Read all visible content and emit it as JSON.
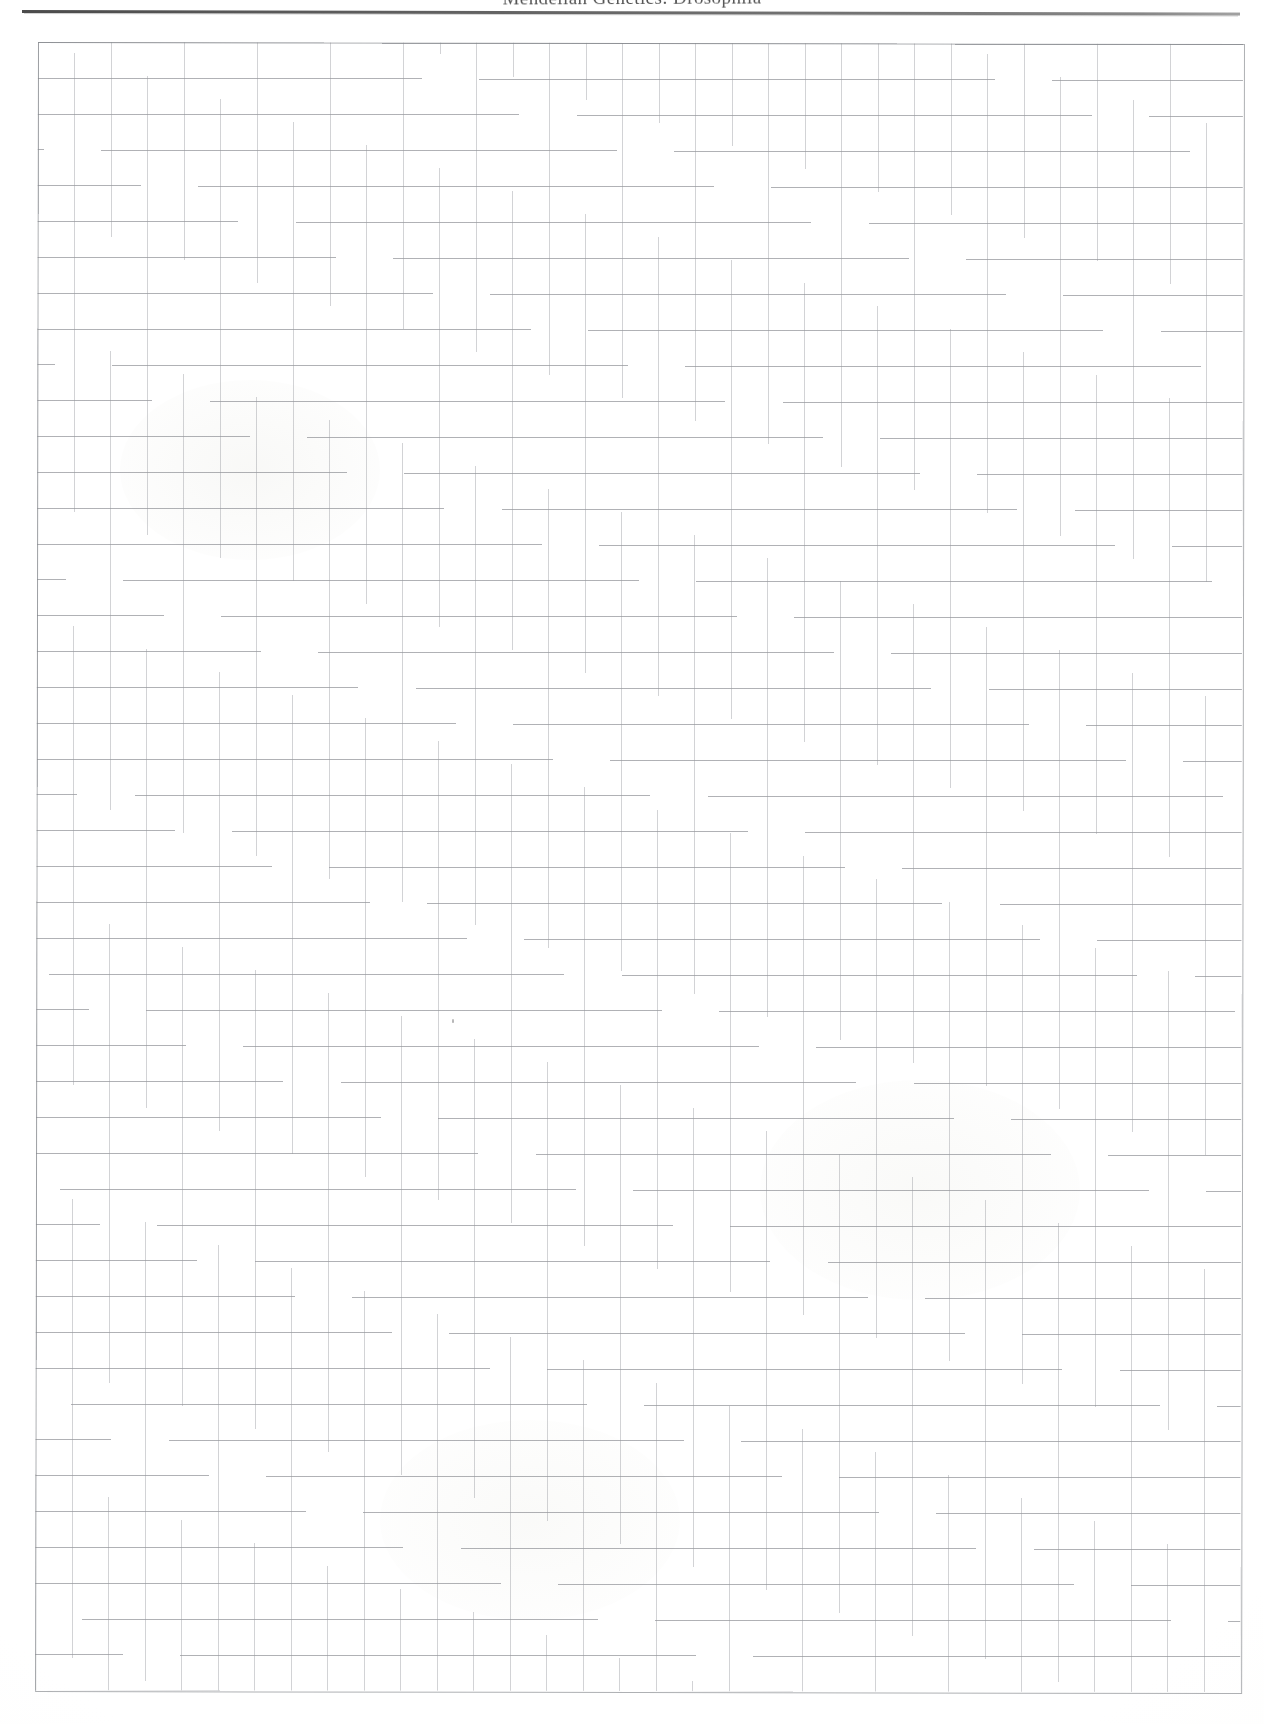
{
  "page": {
    "kind": "scanned-lab-notebook-page",
    "width_px": 1264,
    "height_px": 1724,
    "paper_color": "#fdfdfc"
  },
  "header": {
    "title": "Mendelian Genetics: Drosophila",
    "title_clipped_at_top": true,
    "rule_color": "#4a4a4a"
  },
  "grid": {
    "label": "quadrille-graph-ruling",
    "columns": 33,
    "rows": 46,
    "cell_width_px": 36.5,
    "cell_height_px": 35.8,
    "origin_x_px": 38,
    "origin_y_px": 42,
    "line_color": "#82848a",
    "vertical_line_color": "#96989e",
    "border_color": "#7d7f85"
  },
  "content": {
    "body_text": "",
    "notes": "",
    "is_blank": true,
    "stray_marks": [
      {
        "name": "faint-pencil-speck",
        "x_px": 452,
        "y_px": 1019
      }
    ]
  }
}
